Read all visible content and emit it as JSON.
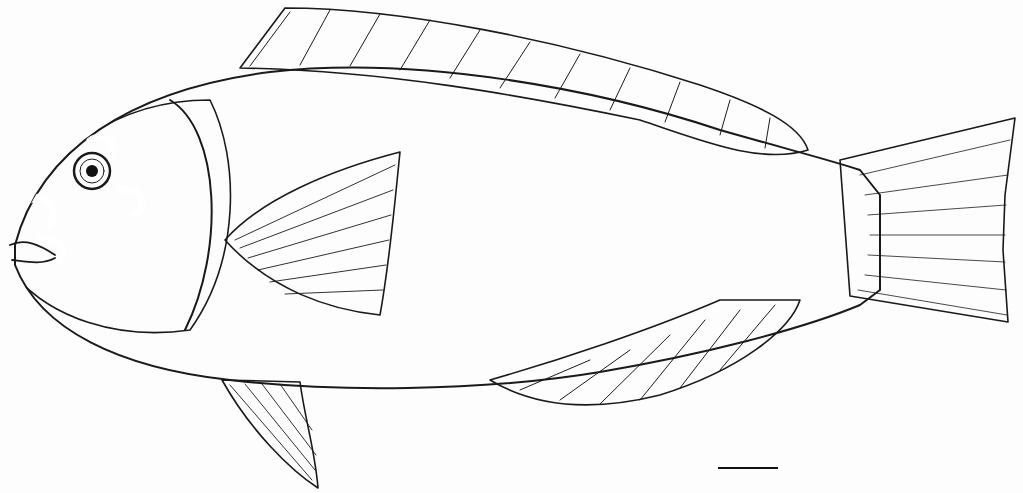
{
  "illustration": {
    "subject": "parrotfish",
    "style": "stipple ink drawing",
    "colors": {
      "ink": "#1a1a1a",
      "paper": "#fdfdfd",
      "fin_shade": "#d9d9d9",
      "scale_shade": "#f1f1f1"
    },
    "parts": [
      {
        "name": "head",
        "label": ""
      },
      {
        "name": "eye",
        "label": ""
      },
      {
        "name": "dorsal-fin",
        "label": ""
      },
      {
        "name": "pectoral-fin",
        "label": ""
      },
      {
        "name": "pelvic-fin",
        "label": ""
      },
      {
        "name": "anal-fin",
        "label": ""
      },
      {
        "name": "caudal-fin",
        "label": ""
      },
      {
        "name": "scaled-body",
        "label": ""
      }
    ],
    "scale_bar": {
      "x1": 718,
      "x2": 778,
      "y": 468,
      "label": ""
    }
  }
}
